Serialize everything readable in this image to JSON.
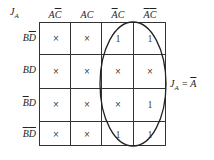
{
  "map": {
    "function_name": "J",
    "function_sub": "A",
    "columns": [
      {
        "label": "AC̄",
        "parts": [
          {
            "t": "A",
            "ol": false
          },
          {
            "t": "C",
            "ol": true
          }
        ]
      },
      {
        "label": "AC",
        "parts": [
          {
            "t": "A",
            "ol": false
          },
          {
            "t": "C",
            "ol": false
          }
        ]
      },
      {
        "label": "ĀC",
        "parts": [
          {
            "t": "A",
            "ol": true
          },
          {
            "t": "C",
            "ol": false
          }
        ]
      },
      {
        "label": "ĀC̄",
        "parts": [
          {
            "t": "A",
            "ol": true
          },
          {
            "t": "C",
            "ol": true
          }
        ]
      }
    ],
    "rows": [
      {
        "label": "BD̄",
        "cells": [
          "×",
          "×",
          "1",
          "1"
        ]
      },
      {
        "label": "BD",
        "cells": [
          "×",
          "×",
          "×",
          "×"
        ]
      },
      {
        "label": "B̄D",
        "cells": [
          "×",
          "×",
          "×",
          "1"
        ]
      },
      {
        "label": "B̄D̄",
        "cells": [
          "×",
          "×",
          "1",
          "1"
        ]
      }
    ],
    "grouping": "columns ĀC and ĀC̄ (all rows) enclosed in oval",
    "result": {
      "lhs": "J",
      "lhs_sub": "A",
      "rhs": "A",
      "rhs_bar": true
    }
  }
}
